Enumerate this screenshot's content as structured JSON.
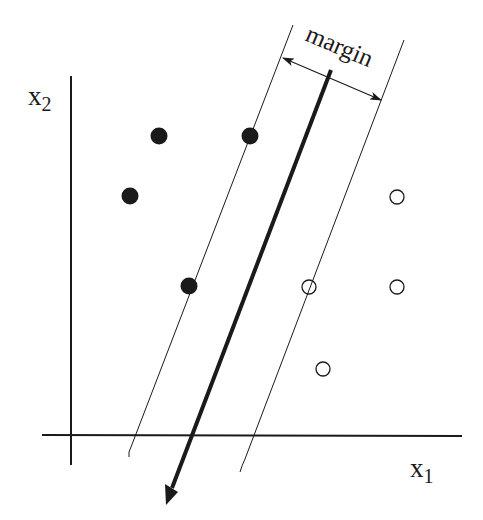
{
  "diagram": {
    "labels": {
      "x1_base": "x",
      "x1_sub": "1",
      "x2_base": "x",
      "x2_sub": "2",
      "margin": "margin"
    },
    "colors": {
      "ink": "#1a1a1a",
      "background": "#ffffff"
    },
    "axes": {
      "y_axis": {
        "x": 71,
        "y1": 76,
        "y2": 465
      },
      "x_axis": {
        "y": 435,
        "x1": 42,
        "x2": 462
      }
    },
    "class_filled": [
      {
        "x": 159,
        "y": 136
      },
      {
        "x": 250,
        "y": 136
      },
      {
        "x": 130,
        "y": 196
      },
      {
        "x": 189,
        "y": 286
      }
    ],
    "class_open": [
      {
        "x": 397,
        "y": 197
      },
      {
        "x": 309,
        "y": 287
      },
      {
        "x": 397,
        "y": 287
      },
      {
        "x": 323,
        "y": 369
      }
    ],
    "support_vectors": [
      {
        "x": 250,
        "y": 136,
        "class": "filled"
      },
      {
        "x": 189,
        "y": 286,
        "class": "filled"
      },
      {
        "x": 309,
        "y": 287,
        "class": "open"
      }
    ],
    "lines": {
      "left_margin": {
        "x1": 293,
        "y1": 25,
        "x2": 131,
        "y2": 447
      },
      "right_margin": {
        "x1": 404,
        "y1": 40,
        "x2": 245,
        "y2": 459
      },
      "separator": {
        "x1": 331,
        "y1": 70,
        "x2": 170,
        "y2": 494
      },
      "margin_arrow": {
        "x1": 281,
        "y1": 57,
        "x2": 383,
        "y2": 101
      }
    }
  }
}
